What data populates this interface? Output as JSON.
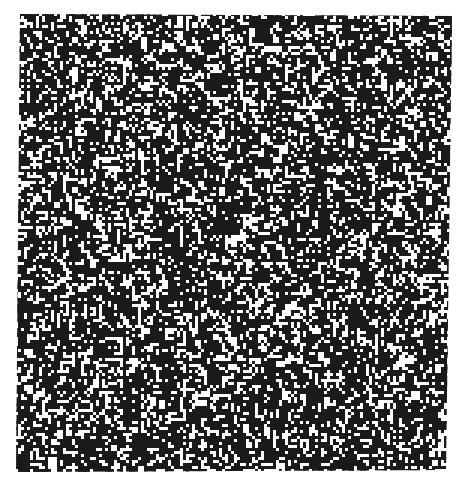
{
  "image": {
    "description": "Black and white maze-like random noise texture on white background",
    "background_color": "#ffffff",
    "ink_color": "#1a1a1a",
    "region": {
      "top_left": [
        20,
        14
      ],
      "top_right": [
        452,
        16
      ],
      "bottom_right": [
        446,
        470
      ],
      "bottom_left": [
        16,
        472
      ]
    },
    "seed": 1337,
    "cell_size": 3,
    "density": 0.5
  }
}
